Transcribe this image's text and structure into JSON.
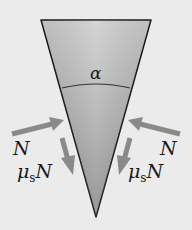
{
  "diagram": {
    "angle_label": "α",
    "left": {
      "normal_label": "N",
      "friction_mu": "μ",
      "friction_sub": "s",
      "friction_N": "N"
    },
    "right": {
      "normal_label": "N",
      "friction_mu": "μ",
      "friction_sub": "s",
      "friction_N": "N"
    },
    "colors": {
      "background": "#ebebeb",
      "wedge_light": "#c8c8c8",
      "wedge_dark": "#8c8c8c",
      "arrow": "#8a8a8a",
      "outline": "#1a1a1a"
    }
  }
}
